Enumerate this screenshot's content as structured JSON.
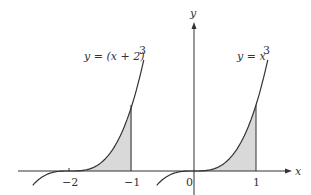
{
  "chart_data": {
    "type": "line",
    "title": "",
    "xlabel": "x",
    "ylabel": "y",
    "series": [
      {
        "name": "y = (x + 2)^3",
        "label": "y = (x + 2)",
        "exponent": "3",
        "shaded_interval": [
          -2,
          -1
        ]
      },
      {
        "name": "y = x^3",
        "label": "y = x",
        "exponent": "3",
        "shaded_interval": [
          0,
          1
        ]
      }
    ],
    "x_ticks": [
      "−2",
      "−1",
      "0",
      "1"
    ],
    "grid": false,
    "colors": {
      "curve": "#333333",
      "shade": "#d9d9d9",
      "axis": "#333333"
    }
  }
}
